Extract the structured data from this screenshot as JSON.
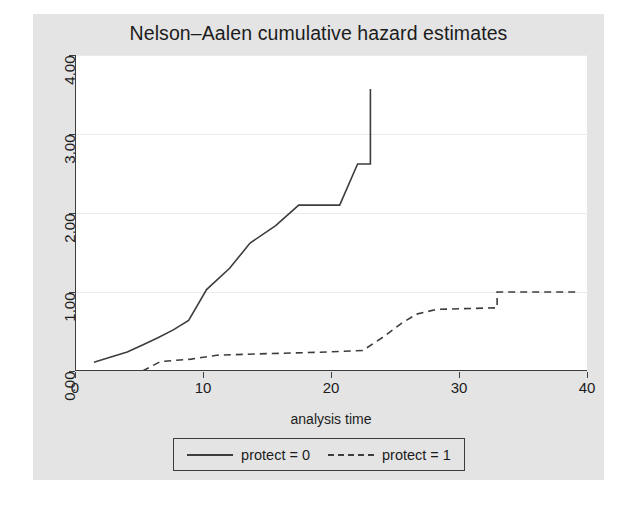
{
  "chart_data": {
    "type": "line",
    "subtype": "step-post",
    "title": "Nelson–Aalen cumulative hazard estimates",
    "xlabel": "analysis time",
    "ylabel": "",
    "xlim": [
      0,
      40
    ],
    "ylim": [
      0,
      4
    ],
    "xticks": [
      0,
      10,
      20,
      30,
      40
    ],
    "xtick_labels": [
      "0",
      "10",
      "20",
      "30",
      "40"
    ],
    "yticks": [
      0,
      1,
      2,
      3,
      4
    ],
    "ytick_labels": [
      "0.00",
      "1.00",
      "2.00",
      "3.00",
      "4.00"
    ],
    "grid": "horizontal",
    "legend_position": "bottom-center",
    "series": [
      {
        "name": "protect = 0",
        "linestyle": "solid",
        "color": "#3d3d3d",
        "x": [
          1.4,
          1.4,
          2.6,
          2.6,
          4.0,
          4.0,
          5.2,
          5.2,
          6.4,
          6.4,
          7.6,
          7.6,
          8.8,
          8.8,
          10.2,
          10.2,
          12.0,
          12.0,
          13.6,
          13.6,
          15.6,
          15.6,
          17.4,
          17.4,
          20.6,
          20.6,
          22.0,
          22.0,
          23.0,
          23.0
        ],
        "y": [
          0.11,
          0.11,
          0.17,
          0.17,
          0.24,
          0.24,
          0.33,
          0.33,
          0.42,
          0.42,
          0.52,
          0.52,
          0.64,
          0.64,
          1.03,
          1.03,
          1.3,
          1.3,
          1.62,
          1.62,
          1.84,
          1.84,
          2.1,
          2.1,
          2.1,
          2.1,
          2.62,
          2.62,
          2.62,
          3.57
        ]
      },
      {
        "name": "protect = 1",
        "linestyle": "dashed",
        "color": "#3d3d3d",
        "x": [
          5.2,
          5.2,
          6.6,
          6.6,
          9.0,
          9.0,
          11.0,
          11.0,
          15.0,
          15.0,
          19.6,
          19.6,
          22.4,
          22.4,
          24.0,
          24.0,
          25.4,
          25.4,
          26.6,
          26.6,
          28.2,
          28.2,
          32.9,
          32.9,
          39.2
        ],
        "y": [
          0.0,
          0.0,
          0.12,
          0.12,
          0.15,
          0.15,
          0.2,
          0.2,
          0.22,
          0.22,
          0.24,
          0.24,
          0.26,
          0.26,
          0.43,
          0.43,
          0.6,
          0.6,
          0.72,
          0.72,
          0.78,
          0.78,
          0.8,
          1.0,
          1.0
        ]
      }
    ]
  },
  "legend": {
    "entries": [
      {
        "label": "protect = 0",
        "style": "solid"
      },
      {
        "label": "protect = 1",
        "style": "dashed"
      }
    ]
  },
  "colors": {
    "figure_background": "#e4e4e4",
    "plot_background": "#ffffff",
    "axis": "#3d3d3d",
    "grid": "#eaeaea",
    "text": "#1c1c1c"
  }
}
